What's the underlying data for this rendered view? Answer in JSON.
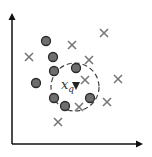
{
  "diagram": {
    "colors": {
      "axis": "#111111",
      "circle_fill": "#6e6e6e",
      "circle_stroke": "#2a2a2a",
      "cross": "#777777",
      "dashed_circle": "#444444",
      "query": "#222222"
    },
    "axes": {
      "origin": [
        12,
        144
      ],
      "y_top": 13,
      "x_right": 143
    },
    "circles": [
      {
        "x": 46,
        "y": 41
      },
      {
        "x": 53,
        "y": 57
      },
      {
        "x": 54,
        "y": 71
      },
      {
        "x": 36,
        "y": 83
      },
      {
        "x": 76,
        "y": 68
      },
      {
        "x": 54,
        "y": 98
      },
      {
        "x": 65,
        "y": 106
      },
      {
        "x": 90,
        "y": 98
      }
    ],
    "crosses": [
      {
        "x": 104,
        "y": 33
      },
      {
        "x": 72,
        "y": 45
      },
      {
        "x": 29,
        "y": 57
      },
      {
        "x": 89,
        "y": 60
      },
      {
        "x": 85,
        "y": 80
      },
      {
        "x": 118,
        "y": 79
      },
      {
        "x": 107,
        "y": 102
      },
      {
        "x": 79,
        "y": 107
      },
      {
        "x": 58,
        "y": 122
      }
    ],
    "neighborhood": {
      "cx": 75,
      "cy": 87,
      "r": 24
    },
    "query": {
      "x": 76,
      "y": 86,
      "label_main": "x",
      "label_sub": "q"
    }
  }
}
